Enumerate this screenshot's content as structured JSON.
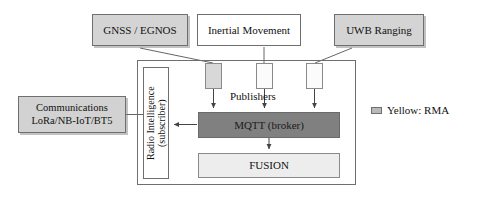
{
  "diagram": {
    "title_present": false,
    "sources": [
      {
        "id": "gnss",
        "label": "GNSS / EGNOS",
        "fill": "#d4d4d4",
        "shaded": true
      },
      {
        "id": "inertial",
        "label": "Inertial Movement",
        "fill": "#ffffff",
        "shaded": false
      },
      {
        "id": "uwb",
        "label": "UWB Ranging",
        "fill": "#d4d4d4",
        "shaded": true
      }
    ],
    "publishers": {
      "label": "Publishers",
      "nodes": [
        {
          "id": "pub-gnss",
          "fill": "#d8d8d8",
          "source": "gnss"
        },
        {
          "id": "pub-inertial",
          "fill": "#fbfbfb",
          "source": "inertial"
        },
        {
          "id": "pub-uwb",
          "fill": "#fbfbfb",
          "source": "uwb"
        }
      ]
    },
    "radio_intelligence": {
      "line1": "Radio Intelligence",
      "line2": "(subscriber)",
      "text": "Radio Intelligence\n(subscriber)",
      "orientation": "vertical-ccw",
      "fill": "#ffffff"
    },
    "communications": {
      "line1": "Communications",
      "line2": "LoRa/NB-IoT/BT5",
      "text": "Communications\nLoRa/NB-IoT/BT5",
      "fill": "#d2d2d2",
      "shaded": true
    },
    "broker": {
      "label": "MQTT (broker)",
      "fill": "#808080"
    },
    "fusion": {
      "label": "FUSION",
      "fill": "#ededed"
    },
    "legend": {
      "swatch_color": "#b9b9b9",
      "label": "Yellow: RMA"
    }
  }
}
